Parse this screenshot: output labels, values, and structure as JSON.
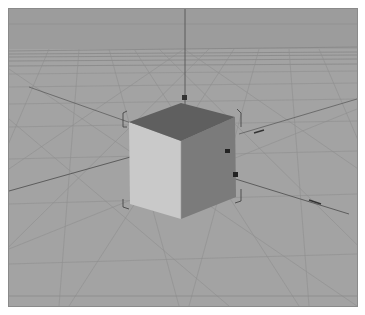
{
  "viewport": {
    "view_name": "Perspective",
    "colors": {
      "sky": "#9c9c9c",
      "floor": "#a4a4a4",
      "grid_line": "#8c8c8c",
      "axis_line": "#555555",
      "cube_front": "#c8c8c8",
      "cube_side": "#7a7a7a",
      "cube_top": "#5e5e5e",
      "bounding_box": "#3a3a3a"
    },
    "object": {
      "type": "cube",
      "selected": true,
      "icon": "cube-icon"
    },
    "axes": [
      "x-axis",
      "y-axis",
      "z-axis"
    ]
  }
}
